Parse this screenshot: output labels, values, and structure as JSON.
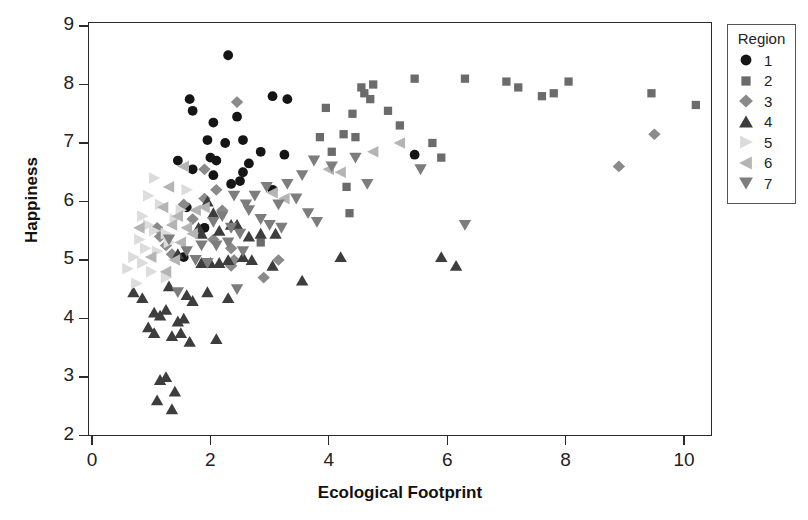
{
  "chart_data": {
    "type": "scatter",
    "title": "",
    "xlabel": "Ecological Footprint",
    "ylabel": "Happiness",
    "xlim": [
      -0.55,
      10.5
    ],
    "ylim": [
      2,
      9
    ],
    "xticks": [
      0,
      2,
      4,
      6,
      8,
      10
    ],
    "yticks": [
      2,
      3,
      4,
      5,
      6,
      7,
      8,
      9
    ],
    "grid": false,
    "legend": {
      "title": "Region",
      "position": "right-outside",
      "entries": [
        {
          "label": "1",
          "marker": "circle",
          "color": "#151515"
        },
        {
          "label": "2",
          "marker": "square",
          "color": "#6b6b6b"
        },
        {
          "label": "3",
          "marker": "diamond",
          "color": "#8a8a8a"
        },
        {
          "label": "4",
          "marker": "triangle-up",
          "color": "#3d3d3d"
        },
        {
          "label": "5",
          "marker": "triangle-right",
          "color": "#dcdcdc"
        },
        {
          "label": "6",
          "marker": "triangle-left",
          "color": "#b4b4b4"
        },
        {
          "label": "7",
          "marker": "triangle-down",
          "color": "#7d7d7d"
        }
      ]
    },
    "series": [
      {
        "name": "1",
        "marker": "circle",
        "color": "#151515",
        "points": [
          [
            2.3,
            8.5
          ],
          [
            1.65,
            7.75
          ],
          [
            1.7,
            7.55
          ],
          [
            3.05,
            7.8
          ],
          [
            3.3,
            7.75
          ],
          [
            2.05,
            7.35
          ],
          [
            2.45,
            7.45
          ],
          [
            1.95,
            7.05
          ],
          [
            2.25,
            7.0
          ],
          [
            2.55,
            7.05
          ],
          [
            1.45,
            6.7
          ],
          [
            2.0,
            6.75
          ],
          [
            2.1,
            6.7
          ],
          [
            2.85,
            6.85
          ],
          [
            3.25,
            6.8
          ],
          [
            2.05,
            6.45
          ],
          [
            2.35,
            6.3
          ],
          [
            2.5,
            6.35
          ],
          [
            2.55,
            6.5
          ],
          [
            3.05,
            6.2
          ],
          [
            1.6,
            5.9
          ],
          [
            1.7,
            6.55
          ],
          [
            2.65,
            6.65
          ],
          [
            5.45,
            6.8
          ],
          [
            1.55,
            5.05
          ],
          [
            1.9,
            5.55
          ]
        ]
      },
      {
        "name": "2",
        "marker": "square",
        "color": "#6b6b6b",
        "points": [
          [
            4.55,
            7.95
          ],
          [
            4.6,
            7.85
          ],
          [
            4.75,
            8.0
          ],
          [
            4.7,
            7.75
          ],
          [
            5.45,
            8.1
          ],
          [
            6.3,
            8.1
          ],
          [
            7.0,
            8.05
          ],
          [
            7.2,
            7.95
          ],
          [
            7.6,
            7.8
          ],
          [
            7.8,
            7.85
          ],
          [
            8.05,
            8.05
          ],
          [
            9.45,
            7.85
          ],
          [
            10.2,
            7.65
          ],
          [
            3.95,
            7.6
          ],
          [
            5.0,
            7.55
          ],
          [
            4.4,
            7.5
          ],
          [
            5.2,
            7.3
          ],
          [
            3.85,
            7.1
          ],
          [
            4.25,
            7.15
          ],
          [
            4.45,
            7.1
          ],
          [
            5.75,
            7.0
          ],
          [
            4.05,
            6.85
          ],
          [
            5.9,
            6.75
          ],
          [
            4.3,
            6.25
          ],
          [
            2.85,
            5.3
          ],
          [
            4.35,
            5.8
          ]
        ]
      },
      {
        "name": "3",
        "marker": "diamond",
        "color": "#8a8a8a",
        "points": [
          [
            2.45,
            7.7
          ],
          [
            1.9,
            6.55
          ],
          [
            1.1,
            5.55
          ],
          [
            1.15,
            5.4
          ],
          [
            1.25,
            5.25
          ],
          [
            1.55,
            5.95
          ],
          [
            1.9,
            6.05
          ],
          [
            2.2,
            5.85
          ],
          [
            2.05,
            5.35
          ],
          [
            2.35,
            5.2
          ],
          [
            2.4,
            5.0
          ],
          [
            2.35,
            4.9
          ],
          [
            2.9,
            4.7
          ],
          [
            1.35,
            5.1
          ],
          [
            8.9,
            6.6
          ],
          [
            9.5,
            7.15
          ],
          [
            2.1,
            6.2
          ],
          [
            1.7,
            5.7
          ],
          [
            3.15,
            5.0
          ]
        ]
      },
      {
        "name": "4",
        "marker": "triangle-up",
        "color": "#3d3d3d",
        "points": [
          [
            1.95,
            6.0
          ],
          [
            2.05,
            5.8
          ],
          [
            1.8,
            5.55
          ],
          [
            1.85,
            5.45
          ],
          [
            2.15,
            5.5
          ],
          [
            2.35,
            5.6
          ],
          [
            2.45,
            5.6
          ],
          [
            2.65,
            5.4
          ],
          [
            2.85,
            5.45
          ],
          [
            3.1,
            5.45
          ],
          [
            1.45,
            5.1
          ],
          [
            1.85,
            4.95
          ],
          [
            2.0,
            4.95
          ],
          [
            2.15,
            4.95
          ],
          [
            2.3,
            5.0
          ],
          [
            2.55,
            5.05
          ],
          [
            2.7,
            5.0
          ],
          [
            3.05,
            4.9
          ],
          [
            3.55,
            4.65
          ],
          [
            4.2,
            5.05
          ],
          [
            1.3,
            4.55
          ],
          [
            1.05,
            4.1
          ],
          [
            1.15,
            4.05
          ],
          [
            1.25,
            4.15
          ],
          [
            1.45,
            3.95
          ],
          [
            1.55,
            4.0
          ],
          [
            0.95,
            3.85
          ],
          [
            1.05,
            3.75
          ],
          [
            1.35,
            3.7
          ],
          [
            1.5,
            3.75
          ],
          [
            0.85,
            4.35
          ],
          [
            0.7,
            4.45
          ],
          [
            1.6,
            4.4
          ],
          [
            1.7,
            4.3
          ],
          [
            1.95,
            4.45
          ],
          [
            2.3,
            4.35
          ],
          [
            1.15,
            2.95
          ],
          [
            1.25,
            3.0
          ],
          [
            1.4,
            2.75
          ],
          [
            1.1,
            2.6
          ],
          [
            1.35,
            2.45
          ],
          [
            5.9,
            5.05
          ],
          [
            6.15,
            4.9
          ],
          [
            2.1,
            3.65
          ],
          [
            1.65,
            3.6
          ]
        ]
      },
      {
        "name": "5",
        "marker": "triangle-right",
        "color": "#dcdcdc",
        "points": [
          [
            1.05,
            6.4
          ],
          [
            0.95,
            6.1
          ],
          [
            1.15,
            5.95
          ],
          [
            0.85,
            5.75
          ],
          [
            0.95,
            5.6
          ],
          [
            1.05,
            5.5
          ],
          [
            1.25,
            5.45
          ],
          [
            0.8,
            5.35
          ],
          [
            0.9,
            5.2
          ],
          [
            1.1,
            5.15
          ],
          [
            1.3,
            5.3
          ],
          [
            0.7,
            5.05
          ],
          [
            0.85,
            4.95
          ],
          [
            1.0,
            4.8
          ],
          [
            1.25,
            4.7
          ],
          [
            0.75,
            4.6
          ],
          [
            1.4,
            5.7
          ],
          [
            1.5,
            5.85
          ],
          [
            1.6,
            6.2
          ],
          [
            0.6,
            4.85
          ]
        ]
      },
      {
        "name": "6",
        "marker": "triangle-left",
        "color": "#b4b4b4",
        "points": [
          [
            1.55,
            6.6
          ],
          [
            1.3,
            6.25
          ],
          [
            1.2,
            5.9
          ],
          [
            1.45,
            5.75
          ],
          [
            1.35,
            5.6
          ],
          [
            1.6,
            5.55
          ],
          [
            1.7,
            5.45
          ],
          [
            1.5,
            5.3
          ],
          [
            1.75,
            5.85
          ],
          [
            1.9,
            5.9
          ],
          [
            4.75,
            6.85
          ],
          [
            5.2,
            7.0
          ],
          [
            4.0,
            6.55
          ],
          [
            4.2,
            6.5
          ],
          [
            1.4,
            5.0
          ],
          [
            1.25,
            4.8
          ],
          [
            1.0,
            5.05
          ],
          [
            0.8,
            5.55
          ],
          [
            3.05,
            6.15
          ],
          [
            3.25,
            6.05
          ]
        ]
      },
      {
        "name": "7",
        "marker": "triangle-down",
        "color": "#7d7d7d",
        "points": [
          [
            3.55,
            6.45
          ],
          [
            3.3,
            6.3
          ],
          [
            3.45,
            6.05
          ],
          [
            2.95,
            6.25
          ],
          [
            3.15,
            5.95
          ],
          [
            2.75,
            6.1
          ],
          [
            2.6,
            5.95
          ],
          [
            2.4,
            6.1
          ],
          [
            2.2,
            5.75
          ],
          [
            2.05,
            5.65
          ],
          [
            2.35,
            5.55
          ],
          [
            2.5,
            5.45
          ],
          [
            2.65,
            5.85
          ],
          [
            2.85,
            5.7
          ],
          [
            3.0,
            5.6
          ],
          [
            3.2,
            5.55
          ],
          [
            3.65,
            5.8
          ],
          [
            3.8,
            5.65
          ],
          [
            4.45,
            6.75
          ],
          [
            4.65,
            6.3
          ],
          [
            6.3,
            5.6
          ],
          [
            1.85,
            5.25
          ],
          [
            2.1,
            5.25
          ],
          [
            2.3,
            5.3
          ],
          [
            1.6,
            5.15
          ],
          [
            1.75,
            5.0
          ],
          [
            1.95,
            4.95
          ],
          [
            1.45,
            4.45
          ],
          [
            1.3,
            5.35
          ],
          [
            2.55,
            5.15
          ],
          [
            4.05,
            6.6
          ],
          [
            3.75,
            6.7
          ],
          [
            2.45,
            4.5
          ],
          [
            5.55,
            6.55
          ]
        ]
      }
    ]
  }
}
